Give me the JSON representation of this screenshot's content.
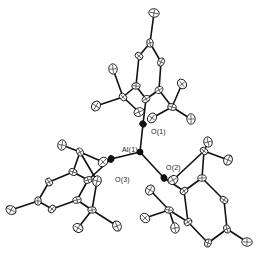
{
  "diagram": {
    "type": "ORTEP molecular structure",
    "labels": {
      "al1": "Al(1)",
      "o1": "O(1)",
      "o2": "O(2)",
      "o3": "O(3)"
    },
    "atoms": [
      {
        "id": "Al1",
        "x": 140,
        "y": 152,
        "type": "metal"
      },
      {
        "id": "O1",
        "x": 143,
        "y": 124,
        "type": "oxygen"
      },
      {
        "id": "O2",
        "x": 164,
        "y": 178,
        "type": "oxygen"
      },
      {
        "id": "O3",
        "x": 111,
        "y": 159,
        "type": "oxygen"
      },
      {
        "id": "C1",
        "x": 146,
        "y": 99,
        "type": "carbon"
      },
      {
        "id": "C2",
        "x": 136,
        "y": 86
      },
      {
        "id": "C3",
        "x": 139,
        "y": 56
      },
      {
        "id": "C4",
        "x": 150,
        "y": 43
      },
      {
        "id": "C5",
        "x": 161,
        "y": 62
      },
      {
        "id": "C6",
        "x": 159,
        "y": 90
      },
      {
        "id": "C7",
        "x": 154,
        "y": 13
      },
      {
        "id": "C8",
        "x": 123,
        "y": 97
      },
      {
        "id": "C9",
        "x": 113,
        "y": 69
      },
      {
        "id": "C10",
        "x": 96,
        "y": 106
      },
      {
        "id": "C11",
        "x": 139,
        "y": 112
      },
      {
        "id": "C12",
        "x": 172,
        "y": 107
      },
      {
        "id": "C13",
        "x": 182,
        "y": 84
      },
      {
        "id": "C14",
        "x": 191,
        "y": 119
      },
      {
        "id": "C15",
        "x": 152,
        "y": 118
      },
      {
        "id": "C16",
        "x": 88,
        "y": 180
      },
      {
        "id": "C17",
        "x": 73,
        "y": 172
      },
      {
        "id": "C18",
        "x": 49,
        "y": 182
      },
      {
        "id": "C19",
        "x": 38,
        "y": 201
      },
      {
        "id": "C20",
        "x": 52,
        "y": 209
      },
      {
        "id": "C21",
        "x": 77,
        "y": 200
      },
      {
        "id": "C22",
        "x": 11,
        "y": 210
      },
      {
        "id": "C23",
        "x": 80,
        "y": 152
      },
      {
        "id": "C24",
        "x": 62,
        "y": 145
      },
      {
        "id": "C25",
        "x": 103,
        "y": 162
      },
      {
        "id": "C26",
        "x": 92,
        "y": 210
      },
      {
        "id": "C27",
        "x": 78,
        "y": 228
      },
      {
        "id": "C28",
        "x": 117,
        "y": 226
      },
      {
        "id": "C29",
        "x": 97,
        "y": 181
      },
      {
        "id": "C30",
        "x": 184,
        "y": 191
      },
      {
        "id": "C31",
        "x": 202,
        "y": 178
      },
      {
        "id": "C32",
        "x": 224,
        "y": 200
      },
      {
        "id": "C33",
        "x": 227,
        "y": 229
      },
      {
        "id": "C34",
        "x": 208,
        "y": 243
      },
      {
        "id": "C35",
        "x": 188,
        "y": 222
      },
      {
        "id": "C36",
        "x": 247,
        "y": 242
      },
      {
        "id": "C37",
        "x": 204,
        "y": 151
      },
      {
        "id": "C38",
        "x": 208,
        "y": 142
      },
      {
        "id": "C39",
        "x": 228,
        "y": 160
      },
      {
        "id": "C40",
        "x": 173,
        "y": 180
      },
      {
        "id": "C41",
        "x": 169,
        "y": 210
      },
      {
        "id": "C42",
        "x": 145,
        "y": 218
      },
      {
        "id": "C43",
        "x": 175,
        "y": 228
      },
      {
        "id": "C44",
        "x": 150,
        "y": 190
      }
    ],
    "bonds": [
      [
        "Al1",
        "O1"
      ],
      [
        "Al1",
        "O2"
      ],
      [
        "Al1",
        "O3"
      ],
      [
        "O1",
        "C1"
      ],
      [
        "C1",
        "C2"
      ],
      [
        "C2",
        "C3"
      ],
      [
        "C3",
        "C4"
      ],
      [
        "C4",
        "C5"
      ],
      [
        "C5",
        "C6"
      ],
      [
        "C6",
        "C1"
      ],
      [
        "C4",
        "C7"
      ],
      [
        "C2",
        "C8"
      ],
      [
        "C8",
        "C9"
      ],
      [
        "C8",
        "C10"
      ],
      [
        "C8",
        "C11"
      ],
      [
        "C6",
        "C12"
      ],
      [
        "C12",
        "C13"
      ],
      [
        "C12",
        "C14"
      ],
      [
        "C12",
        "C15"
      ],
      [
        "O3",
        "C16"
      ],
      [
        "C16",
        "C17"
      ],
      [
        "C17",
        "C18"
      ],
      [
        "C18",
        "C19"
      ],
      [
        "C19",
        "C20"
      ],
      [
        "C20",
        "C21"
      ],
      [
        "C21",
        "C16"
      ],
      [
        "C19",
        "C22"
      ],
      [
        "C17",
        "C23"
      ],
      [
        "C23",
        "C24"
      ],
      [
        "C23",
        "C25"
      ],
      [
        "C23",
        "C29"
      ],
      [
        "C21",
        "C26"
      ],
      [
        "C26",
        "C27"
      ],
      [
        "C26",
        "C28"
      ],
      [
        "C26",
        "C29"
      ],
      [
        "O2",
        "C30"
      ],
      [
        "C30",
        "C31"
      ],
      [
        "C31",
        "C32"
      ],
      [
        "C32",
        "C33"
      ],
      [
        "C33",
        "C34"
      ],
      [
        "C34",
        "C35"
      ],
      [
        "C35",
        "C30"
      ],
      [
        "C33",
        "C36"
      ],
      [
        "C31",
        "C37"
      ],
      [
        "C37",
        "C38"
      ],
      [
        "C37",
        "C39"
      ],
      [
        "C37",
        "C40"
      ],
      [
        "C35",
        "C41"
      ],
      [
        "C41",
        "C42"
      ],
      [
        "C41",
        "C43"
      ],
      [
        "C41",
        "C44"
      ]
    ]
  }
}
